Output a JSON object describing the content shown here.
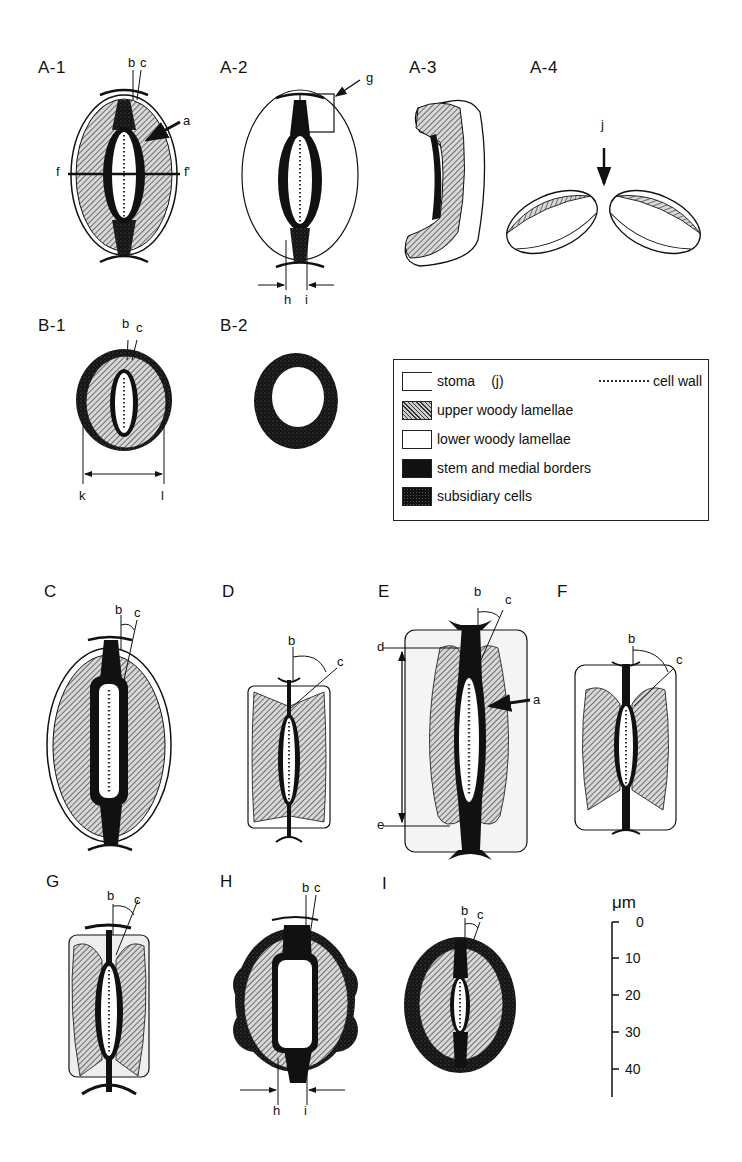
{
  "figure": {
    "panels": {
      "A1": "A-1",
      "A2": "A-2",
      "A3": "A-3",
      "A4": "A-4",
      "B1": "B-1",
      "B2": "B-2",
      "C": "C",
      "D": "D",
      "E": "E",
      "F": "F",
      "G": "G",
      "H": "H",
      "I": "I"
    },
    "annotations": {
      "a": "a",
      "b": "b",
      "c": "c",
      "d": "d",
      "e": "e",
      "f": "f",
      "f_prime": "f'",
      "g": "g",
      "h": "h",
      "i": "i",
      "j": "j",
      "k": "k",
      "l": "l"
    },
    "legend": {
      "items": [
        {
          "swatch": "stoma",
          "label": "stoma",
          "extra": "(j)"
        },
        {
          "swatch": "upper-hatched",
          "label": "upper woody lamellae"
        },
        {
          "swatch": "lower-white",
          "label": "lower woody lamellae"
        },
        {
          "swatch": "stem-black",
          "label": "stem and medial borders"
        },
        {
          "swatch": "subsidiary-stippled",
          "label": "subsidiary cells"
        }
      ],
      "cell_wall_label": "cell wall"
    },
    "scale_bar": {
      "unit": "μm",
      "ticks": [
        "0",
        "10",
        "20",
        "30",
        "40"
      ]
    },
    "colors": {
      "ink": "#111111",
      "hatch_light": "#cccccc",
      "background": "#ffffff"
    }
  }
}
